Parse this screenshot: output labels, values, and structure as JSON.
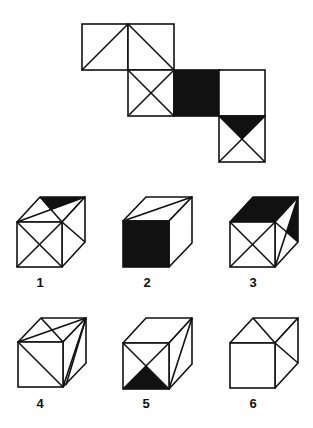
{
  "figure": {
    "type": "cube-net-puzzle",
    "stroke_color": "#111111",
    "fill_color": "#111111",
    "background": "#ffffff"
  },
  "net": {
    "faces": [
      {
        "id": "net-face-a",
        "x": 82,
        "y": 24,
        "size": 46,
        "fill": "white",
        "lines": [
          [
            "bl",
            "tr"
          ]
        ],
        "shaded": []
      },
      {
        "id": "net-face-b",
        "x": 128,
        "y": 24,
        "size": 46,
        "fill": "white",
        "lines": [
          [
            "tl",
            "br"
          ]
        ],
        "shaded": []
      },
      {
        "id": "net-face-c",
        "x": 128,
        "y": 70,
        "size": 46,
        "fill": "white",
        "lines": [
          [
            "tl",
            "br"
          ],
          [
            "tr",
            "bl"
          ]
        ],
        "shaded": []
      },
      {
        "id": "net-face-d",
        "x": 174,
        "y": 70,
        "size": 46,
        "fill": "black",
        "lines": [],
        "shaded": []
      },
      {
        "id": "net-face-e",
        "x": 219,
        "y": 70,
        "size": 46,
        "fill": "white",
        "lines": [],
        "shaded": []
      },
      {
        "id": "net-face-f",
        "x": 219,
        "y": 116,
        "size": 46,
        "fill": "white",
        "lines": [
          [
            "tl",
            "br"
          ],
          [
            "tr",
            "bl"
          ]
        ],
        "shaded": [
          "top"
        ]
      }
    ]
  },
  "options": [
    {
      "label": "1",
      "ox": 17,
      "oy": 222,
      "s": 45,
      "dx": 23,
      "dy": -25,
      "label_x": 40,
      "label_y": 276,
      "front": {
        "fill": "white",
        "lines": [
          [
            "tl",
            "br"
          ],
          [
            "tr",
            "bl"
          ]
        ],
        "shaded": []
      },
      "top": {
        "fill": "white",
        "lines": [
          [
            "fl",
            "br"
          ],
          [
            "bl",
            "fr"
          ]
        ],
        "shaded": [
          "back"
        ]
      },
      "right": {
        "fill": "white",
        "lines": [
          [
            "ft",
            "bb"
          ]
        ],
        "shaded": []
      }
    },
    {
      "label": "2",
      "ox": 123,
      "oy": 221,
      "s": 46,
      "dx": 23,
      "dy": -24,
      "label_x": 147,
      "label_y": 276,
      "front": {
        "fill": "black",
        "lines": [],
        "shaded": []
      },
      "top": {
        "fill": "white",
        "lines": [
          [
            "fl",
            "br"
          ]
        ],
        "shaded": []
      },
      "right": {
        "fill": "white",
        "lines": [],
        "shaded": []
      }
    },
    {
      "label": "3",
      "ox": 230,
      "oy": 222,
      "s": 45,
      "dx": 23,
      "dy": -25,
      "label_x": 253,
      "label_y": 276,
      "front": {
        "fill": "white",
        "lines": [
          [
            "tl",
            "br"
          ],
          [
            "tr",
            "bl"
          ]
        ],
        "shaded": []
      },
      "top": {
        "fill": "black",
        "lines": [],
        "shaded": []
      },
      "right": {
        "fill": "white",
        "lines": [
          [
            "ft",
            "bb"
          ],
          [
            "fb",
            "bt"
          ]
        ],
        "shaded": [
          "back"
        ]
      }
    },
    {
      "label": "4",
      "ox": 18,
      "oy": 342,
      "s": 45,
      "dx": 23,
      "dy": -24,
      "label_x": 40,
      "label_y": 397,
      "front": {
        "fill": "white",
        "lines": [
          [
            "tl",
            "br"
          ]
        ],
        "shaded": []
      },
      "top": {
        "fill": "white",
        "lines": [
          [
            "fl",
            "br"
          ],
          [
            "bl",
            "fr"
          ]
        ],
        "shaded": []
      },
      "right": {
        "fill": "white",
        "lines": [
          [
            "fb",
            "bt"
          ],
          [
            "fb2",
            "bt"
          ]
        ],
        "shaded": []
      }
    },
    {
      "label": "5",
      "ox": 123,
      "oy": 343,
      "s": 46,
      "dx": 23,
      "dy": -25,
      "label_x": 146,
      "label_y": 397,
      "front": {
        "fill": "white",
        "lines": [
          [
            "tl",
            "br"
          ],
          [
            "tr",
            "bl"
          ]
        ],
        "shaded": [
          "bottom"
        ]
      },
      "top": {
        "fill": "white",
        "lines": [],
        "shaded": []
      },
      "right": {
        "fill": "white",
        "lines": [
          [
            "fb",
            "bt"
          ]
        ],
        "shaded": []
      }
    },
    {
      "label": "6",
      "ox": 230,
      "oy": 343,
      "s": 45,
      "dx": 23,
      "dy": -25,
      "label_x": 253,
      "label_y": 397,
      "front": {
        "fill": "white",
        "lines": [],
        "shaded": []
      },
      "top": {
        "fill": "white",
        "lines": [
          [
            "bl",
            "fr"
          ]
        ],
        "shaded": []
      },
      "right": {
        "fill": "white",
        "lines": [
          [
            "ft",
            "bb"
          ]
        ],
        "shaded": []
      }
    }
  ]
}
